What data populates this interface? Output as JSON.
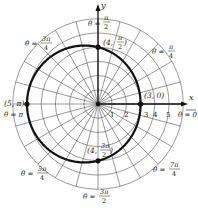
{
  "chart_data": {
    "type": "line",
    "subtype": "polar",
    "title": "",
    "equation": "r = 4 - cos θ",
    "center_px": [
      98,
      104
    ],
    "px_per_unit": 14.2,
    "radial_rings": [
      1,
      2,
      3,
      4,
      5,
      6
    ],
    "radial_tick_labels": [
      "1",
      "2",
      "3",
      "4",
      "5"
    ],
    "angular_spokes_count": 24,
    "axes": {
      "x_label": "x",
      "y_label": "y"
    },
    "angle_labels": [
      {
        "id": "t0",
        "text": "θ = 0",
        "angle_deg": 0
      },
      {
        "id": "t1",
        "text": "θ = π/4",
        "angle_deg": 45
      },
      {
        "id": "t2",
        "text": "θ = π/2",
        "angle_deg": 90
      },
      {
        "id": "t3",
        "text": "θ = 3π/4",
        "angle_deg": 135
      },
      {
        "id": "t4",
        "text": "θ = π",
        "angle_deg": 180
      },
      {
        "id": "t5",
        "text": "θ = 5π/4",
        "angle_deg": 225
      },
      {
        "id": "t6",
        "text": "θ = 3π/2",
        "angle_deg": 270
      },
      {
        "id": "t7",
        "text": "θ = 7π/4",
        "angle_deg": 315
      }
    ],
    "points": [
      {
        "label": "(3, 0)",
        "r": 3,
        "theta": "0"
      },
      {
        "label": "(4, π/2)",
        "r": 4,
        "theta": "π/2"
      },
      {
        "label": "(5, π)",
        "r": 5,
        "theta": "π"
      },
      {
        "label": "(4, 3π/2)",
        "r": 4,
        "theta": "3π/2"
      }
    ],
    "grid": true,
    "legend": null
  },
  "labels": {
    "x_axis": "x",
    "y_axis": "y",
    "theta0": "θ = 0",
    "theta_pi": "θ = π",
    "theta_pi2_top": "θ =",
    "pi2_num": "π",
    "pi2_den": "2",
    "theta_pi4": "θ =",
    "pi4_num": "π",
    "pi4_den": "4",
    "theta_3pi4": "θ =",
    "t3pi4_num": "3π",
    "t3pi4_den": "4",
    "theta_5pi4": "θ =",
    "t5pi4_num": "5π",
    "t5pi4_den": "4",
    "theta_3pi2": "θ =",
    "t3pi2_num": "3π",
    "t3pi2_den": "2",
    "theta_7pi4": "θ =",
    "t7pi4_num": "7π",
    "t7pi4_den": "4",
    "pt_30": "(3, 0)",
    "pt_5pi": "(5, π)",
    "pt_4pi2_a": "(4,",
    "pt_4pi2_num": "π",
    "pt_4pi2_den": "2",
    "pt_4pi2_close": ")",
    "pt_43pi2_a": "(4,",
    "pt_43pi2_num": "3π",
    "pt_43pi2_den": "2",
    "pt_43pi2_close": ")",
    "tick1": "1",
    "tick2": "2",
    "tick3": "3",
    "tick4": "4",
    "tick5": "5"
  }
}
